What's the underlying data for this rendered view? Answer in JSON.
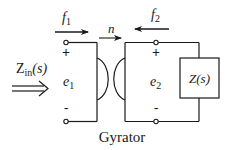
{
  "diagram": {
    "title": "Gyrator",
    "port1": {
      "flow_label": "f",
      "flow_sub": "1",
      "effort_label": "e",
      "effort_sub": "1",
      "plus": "+",
      "minus": "-"
    },
    "port2": {
      "flow_label": "f",
      "flow_sub": "2",
      "effort_label": "e",
      "effort_sub": "2",
      "plus": "+",
      "minus": "-"
    },
    "ratio_label": "n",
    "input_impedance": {
      "main": "Z",
      "sub": "in",
      "arg": "(s)"
    },
    "load_impedance": "Z(s)",
    "colors": {
      "stroke": "#1a1a1a",
      "background": "#ffffff"
    }
  }
}
